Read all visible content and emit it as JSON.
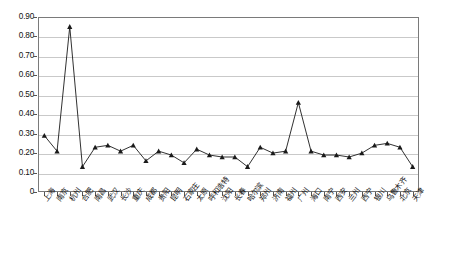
{
  "chart_data": {
    "type": "line",
    "title": "",
    "subtitle": "",
    "xlabel": "",
    "ylabel": "",
    "ylim": [
      0,
      0.9
    ],
    "ytick_labels": [
      "0.90",
      "0.80",
      "0.70",
      "0.60",
      "0.50",
      "0.40",
      "0.30",
      "0.20",
      "0.10",
      "0"
    ],
    "ytick_values": [
      0.9,
      0.8,
      0.7,
      0.6,
      0.5,
      0.4,
      0.3,
      0.2,
      0.1,
      0
    ],
    "grid": true,
    "legend": "none",
    "marker": "triangle",
    "line_color": "#1a1a1a",
    "marker_color": "#1a1a1a",
    "grid_color": "#c9c9c9",
    "axis_color": "#7a7a7a",
    "categories": [
      "上海",
      "南京",
      "杭州",
      "合肥",
      "南昌",
      "武汉",
      "长沙",
      "重庆",
      "成都",
      "贵阳",
      "昆明",
      "石家庄",
      "太原",
      "呼和浩特",
      "沈阳",
      "长春",
      "哈尔滨",
      "郑州",
      "济南",
      "福州",
      "广州",
      "海口",
      "南宁",
      "西安",
      "兰州",
      "西宁",
      "银川",
      "乌鲁木齐",
      "北京",
      "天津"
    ],
    "values": [
      0.29,
      0.21,
      0.85,
      0.13,
      0.23,
      0.24,
      0.21,
      0.24,
      0.16,
      0.21,
      0.19,
      0.15,
      0.22,
      0.19,
      0.18,
      0.18,
      0.13,
      0.23,
      0.2,
      0.21,
      0.46,
      0.21,
      0.19,
      0.19,
      0.18,
      0.2,
      0.24,
      0.25,
      0.23,
      0.13
    ]
  }
}
